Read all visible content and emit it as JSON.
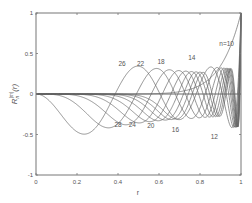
{
  "chart_data": {
    "type": "line",
    "title": "",
    "xlabel": "r",
    "ylabel": "R_n^{|m|}(r)",
    "xlim": [
      0,
      1
    ],
    "ylim": [
      -1,
      1
    ],
    "grid": false,
    "legend": "none (inline curve labels)",
    "x_ticks": [
      "0",
      "0.2",
      "0.4",
      "0.6",
      "0.8",
      "1"
    ],
    "y_ticks": [
      "-1",
      "-0.5",
      "0",
      "0.5",
      "1"
    ],
    "series": [
      {
        "name": "n=10",
        "label": "n=10",
        "peak_r": 1.0,
        "peak_value": 1.0,
        "label_r": 0.93,
        "label_v": 0.62
      },
      {
        "name": "12",
        "label": "12",
        "extreme_r": 0.87,
        "extreme_value": -0.5,
        "label_r": 0.87,
        "label_v": -0.53
      },
      {
        "name": "14",
        "label": "14",
        "extreme_r": 0.76,
        "extreme_value": 0.4,
        "label_r": 0.76,
        "label_v": 0.44
      },
      {
        "name": "16",
        "label": "16",
        "extreme_r": 0.68,
        "extreme_value": -0.38,
        "label_r": 0.68,
        "label_v": -0.44
      },
      {
        "name": "18",
        "label": "18",
        "extreme_r": 0.6,
        "extreme_value": 0.37,
        "label_r": 0.61,
        "label_v": 0.39
      },
      {
        "name": "20",
        "label": "20",
        "extreme_r": 0.55,
        "extreme_value": -0.36,
        "label_r": 0.56,
        "label_v": -0.4
      },
      {
        "name": "22",
        "label": "22",
        "extreme_r": 0.51,
        "extreme_value": 0.35,
        "label_r": 0.51,
        "label_v": 0.37
      },
      {
        "name": "24",
        "label": "24",
        "extreme_r": 0.47,
        "extreme_value": -0.35,
        "label_r": 0.47,
        "label_v": -0.38
      },
      {
        "name": "26",
        "label": "26",
        "extreme_r": 0.43,
        "extreme_value": 0.34,
        "label_r": 0.42,
        "label_v": 0.37
      },
      {
        "name": "28",
        "label": "28",
        "extreme_r": 0.4,
        "extreme_value": -0.34,
        "label_r": 0.4,
        "label_v": -0.38
      }
    ]
  }
}
